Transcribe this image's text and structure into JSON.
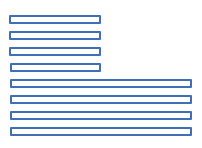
{
  "diagram": {
    "stroke_color": "#3f6fb4",
    "background": "#ffffff",
    "short_fields": [
      {
        "x": 9,
        "y": 15,
        "w": 92
      },
      {
        "x": 9,
        "y": 31,
        "w": 92
      },
      {
        "x": 9,
        "y": 47,
        "w": 92
      },
      {
        "x": 10,
        "y": 63,
        "w": 91
      }
    ],
    "long_fields": [
      {
        "x": 10,
        "y": 79,
        "w": 182
      },
      {
        "x": 10,
        "y": 95,
        "w": 182
      },
      {
        "x": 10,
        "y": 111,
        "w": 182
      },
      {
        "x": 10,
        "y": 127,
        "w": 182
      }
    ]
  }
}
